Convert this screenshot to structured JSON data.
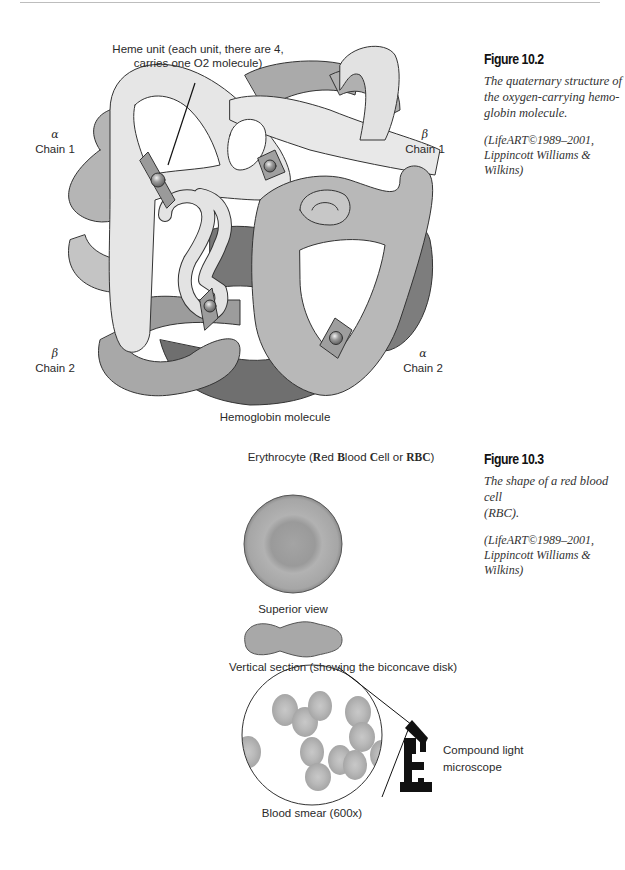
{
  "figure_10_2": {
    "title": "Figure 10.2",
    "caption": "The quaternary structure of the oxygen-carrying hemo-globin molecule.",
    "caption_lines": [
      "The quaternary structure of",
      "the oxygen-carrying hemo-",
      "globin molecule."
    ],
    "credit_lines": [
      "(LifeART©1989–2001,",
      "Lippincott Williams & Wilkins)"
    ],
    "diagram": {
      "heme_label_lines": [
        "Heme unit (each unit, there are 4,",
        "carries one O2 molecule)"
      ],
      "alpha_chain_1": {
        "greek": "α",
        "label": "Chain 1"
      },
      "beta_chain_1": {
        "greek": "β",
        "label": "Chain 1"
      },
      "beta_chain_2": {
        "greek": "β",
        "label": "Chain 2"
      },
      "alpha_chain_2": {
        "greek": "α",
        "label": "Chain 2"
      },
      "bottom_label": "Hemoglobin molecule"
    }
  },
  "figure_10_3": {
    "title": "Figure 10.3",
    "caption_lines": [
      "The shape of a red blood cell",
      "(RBC)."
    ],
    "credit_lines": [
      "(LifeART©1989–2001,",
      "Lippincott Williams & Wilkins)"
    ],
    "diagram": {
      "heading_prefix": "Erythrocyte (",
      "heading_r": "R",
      "heading_ed": "ed ",
      "heading_b": "B",
      "heading_lood": "lood ",
      "heading_c": "C",
      "heading_ell": "ell or ",
      "heading_rbc": "RBC",
      "heading_suffix": ")",
      "superior_view_label": "Superior view",
      "vertical_section_label": "Vertical section (showing the biconcave disk)",
      "microscope_label_lines": [
        "Compound light",
        "microscope"
      ],
      "blood_smear_label": "Blood smear (600x)"
    }
  },
  "colors": {
    "chain_light": "#e4e4e4",
    "chain_mid": "#b7b7b7",
    "chain_dark": "#7d7d7d",
    "chain_darker": "#666666",
    "rbc_fill": "#a9a9a9",
    "outline": "#333333"
  }
}
